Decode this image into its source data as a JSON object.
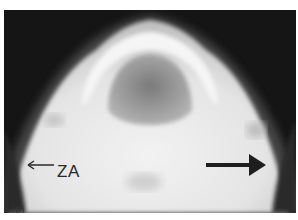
{
  "figure": {
    "panel_label": "(b)",
    "annotations": [
      {
        "text": "ZA",
        "type": "arrow-label",
        "arrow_direction": "left"
      },
      {
        "text": "",
        "type": "arrow",
        "arrow_direction": "right"
      }
    ],
    "colors": {
      "background": "#151515",
      "bone": "#e8e8e8",
      "margin": "#ffffff"
    }
  }
}
